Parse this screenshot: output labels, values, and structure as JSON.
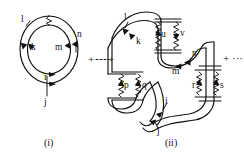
{
  "figure": {
    "background_color": "#ffffff",
    "ink_color": "#111111",
    "panels": [
      {
        "id": "panel-i",
        "caption": "(i)",
        "caption_x": 56,
        "caption_y": 146,
        "type": "double-circle-loop",
        "description": "Two concentric circular propagator lines with directional arrows and a single wavy interaction line at the top",
        "labels": [
          {
            "name": "l",
            "text": "l",
            "x": 21,
            "y": 22,
            "line": "outer"
          },
          {
            "name": "k",
            "text": "k",
            "x": 31,
            "y": 50,
            "line": "inner"
          },
          {
            "name": "m",
            "text": "m",
            "x": 57,
            "y": 50,
            "line": "inner"
          },
          {
            "name": "n",
            "text": "n",
            "x": 77,
            "y": 37,
            "line": "outer"
          },
          {
            "name": "i",
            "text": "i",
            "x": 46,
            "y": 82,
            "line": "inner"
          },
          {
            "name": "j",
            "text": "j",
            "x": 46,
            "y": 105,
            "line": "outer"
          }
        ],
        "wavy_lines": [
          {
            "name": "top-interaction-wavy",
            "from": "outer-top",
            "to": "inner-top"
          }
        ],
        "arrow_count": 6
      },
      {
        "id": "panel-ii",
        "caption": "(ii)",
        "caption_x": 168,
        "caption_y": 146,
        "type": "double-serpentine-loop",
        "description": "Two nested serpentine (S-shaped) propagator lines with three vertical wavy interaction rungs",
        "labels": [
          {
            "name": "l",
            "text": "l",
            "x": 126,
            "y": 20,
            "line": "outer"
          },
          {
            "name": "k",
            "text": "k",
            "x": 141,
            "y": 43,
            "line": "inner"
          },
          {
            "name": "u",
            "text": "u",
            "x": 163,
            "y": 34,
            "line": "wavy"
          },
          {
            "name": "v",
            "text": "v",
            "x": 180,
            "y": 33,
            "line": "wavy"
          },
          {
            "name": "n",
            "text": "n",
            "x": 194,
            "y": 55,
            "line": "outer"
          },
          {
            "name": "m",
            "text": "m",
            "x": 176,
            "y": 70,
            "line": "inner"
          },
          {
            "name": "p",
            "text": "p",
            "x": 126,
            "y": 88,
            "line": "wavy"
          },
          {
            "name": "q",
            "text": "q",
            "x": 143,
            "y": 88,
            "line": "wavy"
          },
          {
            "name": "r",
            "text": "r",
            "x": 197,
            "y": 90,
            "line": "wavy"
          },
          {
            "name": "s",
            "text": "s",
            "x": 216,
            "y": 90,
            "line": "wavy"
          },
          {
            "name": "i",
            "text": "i",
            "x": 170,
            "y": 104,
            "line": "inner"
          },
          {
            "name": "j",
            "text": "j",
            "x": 163,
            "y": 129,
            "line": "outer"
          }
        ],
        "wavy_lines": [
          {
            "name": "rung-uv",
            "labels": [
              "u",
              "v"
            ]
          },
          {
            "name": "rung-pq",
            "labels": [
              "p",
              "q"
            ]
          },
          {
            "name": "rung-rs",
            "labels": [
              "r",
              "s"
            ]
          }
        ],
        "arrow_count": 10
      }
    ],
    "operators": [
      {
        "name": "plus-between-panels",
        "text": "+",
        "x": 95,
        "y": 62
      },
      {
        "name": "ellipsis-between-panels",
        "text": "···",
        "x": 101,
        "y": 61
      },
      {
        "name": "plus-after-panels",
        "text": "+",
        "x": 220,
        "y": 62
      },
      {
        "name": "ellipsis-after-panels",
        "text": "···",
        "x": 230,
        "y": 62
      }
    ]
  }
}
